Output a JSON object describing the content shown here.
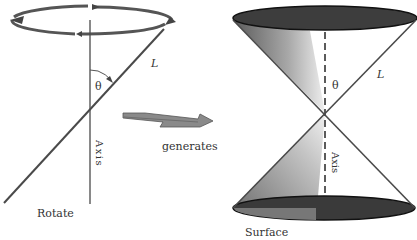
{
  "left_panel": {
    "caption": "Rotate",
    "line_label": "L",
    "angle_label": "θ",
    "axis_label": "Axis"
  },
  "arrow": {
    "label": "generates"
  },
  "right_panel": {
    "caption": "Surface",
    "line_label": "L",
    "angle_label": "θ",
    "axis_label": "Axis"
  },
  "colors": {
    "line": "#4a4a4a",
    "ellipse_dark": "#3a3a3a",
    "rotation_arrow": "#555555",
    "arrow_fill": "#8a8a8a"
  }
}
